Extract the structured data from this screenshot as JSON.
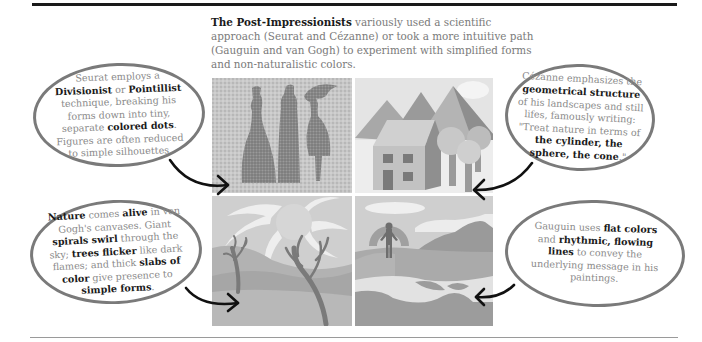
{
  "intro": {
    "bold": "The Post-Impressionists",
    "text": " variously used a scientific approach (Seurat and Cézanne) or took a more intuitive path (Gauguin and van Gogh) to experiment with simplified forms and non-naturalistic colors."
  },
  "bubbles": {
    "seurat": [
      {
        "t": "Seurat employs a ",
        "b": false
      },
      {
        "t": "Divisionist",
        "b": true
      },
      {
        "t": " or ",
        "b": false
      },
      {
        "t": "Pointillist",
        "b": true
      },
      {
        "t": " technique, breaking his forms down into tiny, separate ",
        "b": false
      },
      {
        "t": "colored dots",
        "b": true
      },
      {
        "t": ". Figures are often reduced to simple silhouettes.",
        "b": false
      }
    ],
    "cezanne": [
      {
        "t": "Cézanne emphasizes the ",
        "b": false
      },
      {
        "t": "geometrical structure",
        "b": true
      },
      {
        "t": " of his landscapes and still lifes, famously writing: \"Treat nature in terms of ",
        "b": false
      },
      {
        "t": "the cylinder, the sphere, the cone",
        "b": true
      },
      {
        "t": ".\"",
        "b": false
      }
    ],
    "vangogh": [
      {
        "t": "Nature",
        "b": true
      },
      {
        "t": " comes ",
        "b": false
      },
      {
        "t": "alive",
        "b": true
      },
      {
        "t": " in van Gogh's canvases. Giant ",
        "b": false
      },
      {
        "t": "spirals swirl",
        "b": true
      },
      {
        "t": " through the sky; ",
        "b": false
      },
      {
        "t": "trees flicker",
        "b": true
      },
      {
        "t": " like dark flames; and thick ",
        "b": false
      },
      {
        "t": "slabs of color",
        "b": true
      },
      {
        "t": " give presence to ",
        "b": false
      },
      {
        "t": "simple forms",
        "b": true
      },
      {
        "t": ".",
        "b": false
      }
    ],
    "gauguin": [
      {
        "t": "Gauguin uses ",
        "b": false
      },
      {
        "t": "flat colors",
        "b": true
      },
      {
        "t": " and ",
        "b": false
      },
      {
        "t": "rhythmic, flowing lines",
        "b": true
      },
      {
        "t": " to convey the underlying message in his paintings.",
        "b": false
      }
    ]
  },
  "panels": {
    "seurat": "pointillist-silhouettes",
    "cezanne": "geometric-house-landscape",
    "vangogh": "swirling-sun-trees",
    "gauguin": "flat-color-landscape-figure"
  },
  "colors": {
    "rule": "#1a1a1a",
    "bubble_border": "#7a7a7a",
    "body_text": "#8a8a8a",
    "bold_text": "#1a1a1a"
  }
}
